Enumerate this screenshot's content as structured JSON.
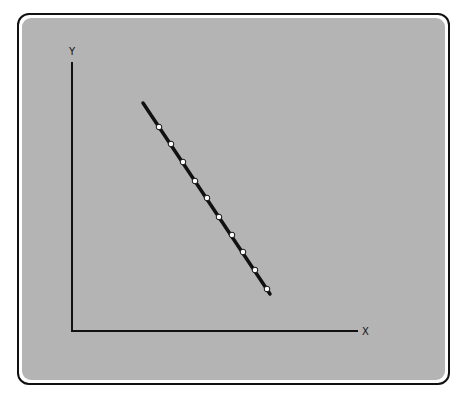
{
  "chart_data": {
    "type": "scatter",
    "title": "",
    "xlabel": "X",
    "ylabel": "Y",
    "x_ticks": [],
    "y_ticks": [],
    "grid": false,
    "legend": null,
    "trend_line": {
      "present": true,
      "direction": "negative",
      "start_px": [
        143,
        103
      ],
      "end_px": [
        270,
        294
      ]
    },
    "points_px": [
      [
        159,
        127
      ],
      [
        171,
        144
      ],
      [
        183,
        162
      ],
      [
        195,
        181
      ],
      [
        207,
        198
      ],
      [
        219,
        217
      ],
      [
        232,
        235
      ],
      [
        243,
        252
      ],
      [
        255,
        270
      ],
      [
        267,
        289
      ]
    ]
  },
  "colors": {
    "panel": "#b4b4b4",
    "line": "#111111",
    "point_fill": "#ffffff"
  }
}
